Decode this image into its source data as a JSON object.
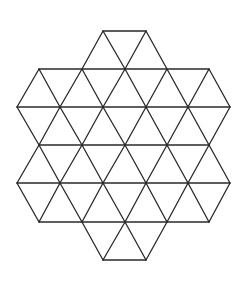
{
  "figure": {
    "background": "#ffffff",
    "stroke_color": "#2a2a2a",
    "stroke_width": 1.3,
    "triangle_side_px": 43,
    "row_height_px": 38,
    "rows": [
      {
        "y": 31,
        "x": [
          103,
          146
        ]
      },
      {
        "y": 69,
        "x": [
          39,
          82,
          125,
          167,
          209
        ]
      },
      {
        "y": 107,
        "x": [
          17,
          60,
          103,
          146,
          188,
          230
        ]
      },
      {
        "y": 145,
        "x": [
          39,
          82,
          125,
          167,
          209
        ]
      },
      {
        "y": 183,
        "x": [
          17,
          60,
          103,
          146,
          188,
          230
        ]
      },
      {
        "y": 222,
        "x": [
          39,
          82,
          125,
          167,
          209
        ]
      },
      {
        "y": 260,
        "x": [
          103,
          146
        ]
      }
    ],
    "edges": [
      [
        103,
        31,
        146,
        31
      ],
      [
        39,
        69,
        209,
        69
      ],
      [
        17,
        107,
        230,
        107
      ],
      [
        39,
        145,
        209,
        145
      ],
      [
        17,
        183,
        230,
        183
      ],
      [
        39,
        222,
        209,
        222
      ],
      [
        103,
        260,
        146,
        260
      ],
      [
        103,
        31,
        82,
        69
      ],
      [
        103,
        31,
        125,
        69
      ],
      [
        146,
        31,
        125,
        69
      ],
      [
        146,
        31,
        167,
        69
      ],
      [
        39,
        69,
        17,
        107
      ],
      [
        39,
        69,
        60,
        107
      ],
      [
        82,
        69,
        60,
        107
      ],
      [
        82,
        69,
        103,
        107
      ],
      [
        125,
        69,
        103,
        107
      ],
      [
        125,
        69,
        146,
        107
      ],
      [
        167,
        69,
        146,
        107
      ],
      [
        167,
        69,
        188,
        107
      ],
      [
        209,
        69,
        188,
        107
      ],
      [
        209,
        69,
        230,
        107
      ],
      [
        17,
        107,
        39,
        145
      ],
      [
        60,
        107,
        39,
        145
      ],
      [
        60,
        107,
        82,
        145
      ],
      [
        103,
        107,
        82,
        145
      ],
      [
        103,
        107,
        125,
        145
      ],
      [
        146,
        107,
        125,
        145
      ],
      [
        146,
        107,
        167,
        145
      ],
      [
        188,
        107,
        167,
        145
      ],
      [
        188,
        107,
        209,
        145
      ],
      [
        230,
        107,
        209,
        145
      ],
      [
        39,
        145,
        17,
        183
      ],
      [
        39,
        145,
        60,
        183
      ],
      [
        82,
        145,
        60,
        183
      ],
      [
        82,
        145,
        103,
        183
      ],
      [
        125,
        145,
        103,
        183
      ],
      [
        125,
        145,
        146,
        183
      ],
      [
        167,
        145,
        146,
        183
      ],
      [
        167,
        145,
        188,
        183
      ],
      [
        209,
        145,
        188,
        183
      ],
      [
        209,
        145,
        230,
        183
      ],
      [
        17,
        183,
        39,
        222
      ],
      [
        60,
        183,
        39,
        222
      ],
      [
        60,
        183,
        82,
        222
      ],
      [
        103,
        183,
        82,
        222
      ],
      [
        103,
        183,
        125,
        222
      ],
      [
        146,
        183,
        125,
        222
      ],
      [
        146,
        183,
        167,
        222
      ],
      [
        188,
        183,
        167,
        222
      ],
      [
        188,
        183,
        209,
        222
      ],
      [
        230,
        183,
        209,
        222
      ],
      [
        82,
        222,
        103,
        260
      ],
      [
        125,
        222,
        103,
        260
      ],
      [
        125,
        222,
        146,
        260
      ],
      [
        167,
        222,
        146,
        260
      ]
    ]
  }
}
